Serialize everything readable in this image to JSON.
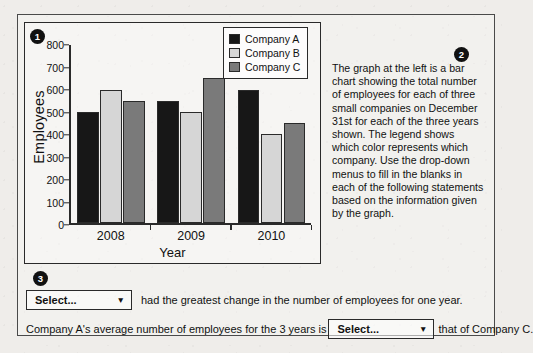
{
  "badges": {
    "one": "1",
    "two": "2",
    "three": "3"
  },
  "chart_data": {
    "type": "bar",
    "title": "",
    "xlabel": "Year",
    "ylabel": "Employees",
    "categories": [
      "2008",
      "2009",
      "2010"
    ],
    "series": [
      {
        "name": "Company A",
        "values": [
          500,
          550,
          600
        ],
        "color": "#171717"
      },
      {
        "name": "Company B",
        "values": [
          600,
          500,
          400
        ],
        "color": "#d6d6d6"
      },
      {
        "name": "Company C",
        "values": [
          550,
          650,
          450
        ],
        "color": "#7a7a7a"
      }
    ],
    "ylim": [
      0,
      800
    ],
    "yticks": [
      0,
      100,
      200,
      300,
      400,
      500,
      600,
      700,
      800
    ],
    "ytick_labels": [
      "0",
      "100",
      "200",
      "300",
      "400",
      "500",
      "600",
      "700",
      "800"
    ],
    "grid": false,
    "legend_position": "top-right"
  },
  "description": {
    "text": "The graph at the left is a bar chart showing the total number of employees for each of three small companies on December 31st for each of the three years shown. The legend shows which color represents which company. Use the drop-down menus to fill in the blanks in each of the following statements based on the information given by the graph."
  },
  "questions": {
    "q1": {
      "select_value": "Select...",
      "caret": "▼",
      "text_after": "had the greatest change in the number of employees for one year."
    },
    "q2": {
      "text_before": "Company A's average number of employees for the 3 years is",
      "select_value": "Select...",
      "caret": "▼",
      "text_after": "that of Company C."
    }
  }
}
